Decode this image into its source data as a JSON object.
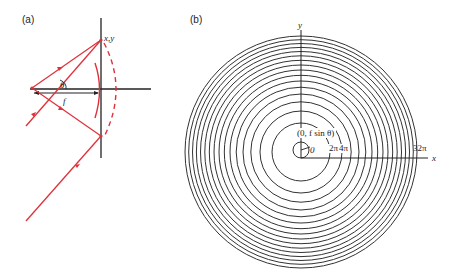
{
  "figure": {
    "panel_a": {
      "label": "(a)",
      "point_label": "x,y",
      "angle_label": "θ",
      "focal_label": "f",
      "ray_color": "#e0303a",
      "axis_color": "#222222"
    },
    "panel_b": {
      "label": "(b)",
      "x_axis_label": "x",
      "y_axis_label": "y",
      "center_label": "(0, f sin θ)",
      "origin_label": "0",
      "ring_labels": [
        "2π",
        "4π",
        "32π"
      ],
      "ring_count": 16,
      "ring_color": "#333333"
    }
  }
}
